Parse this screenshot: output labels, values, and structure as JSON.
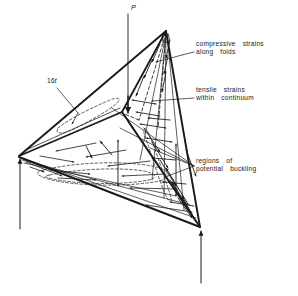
{
  "figure": {
    "name": "tetrahedral-shell-strain-diagram",
    "line_color": "#1a1a1a",
    "background_color": "#ffffff"
  },
  "labels": {
    "load": "P",
    "thickness_number": "16",
    "thickness_symbol": "t",
    "compressive_line1": "compressive  strains",
    "compressive_line2": "along  folds",
    "tensile_line1": "tensile  strains",
    "tensile_line2": "within  continuum",
    "buckling_line1": "regions  of",
    "buckling_line2": "potential  buckling"
  },
  "icon_names": {
    "load_arrow": "down-arrow-icon",
    "reaction_arrow_left": "up-arrow-icon",
    "reaction_arrow_right": "up-arrow-icon",
    "leader_compressive": "leader-line-icon",
    "leader_tensile": "leader-line-icon",
    "leader_buckling": "leader-line-icon"
  },
  "geometry": {
    "apex_top": [
      166,
      30
    ],
    "vertex_left": [
      19,
      156
    ],
    "vertex_bottom_right": [
      200,
      228
    ],
    "vertex_inner": [
      122,
      112
    ],
    "load_axis_x": 128,
    "load_axis_top_y": 14,
    "reaction_left_base_y": 229,
    "reaction_right_base_y": 283
  }
}
